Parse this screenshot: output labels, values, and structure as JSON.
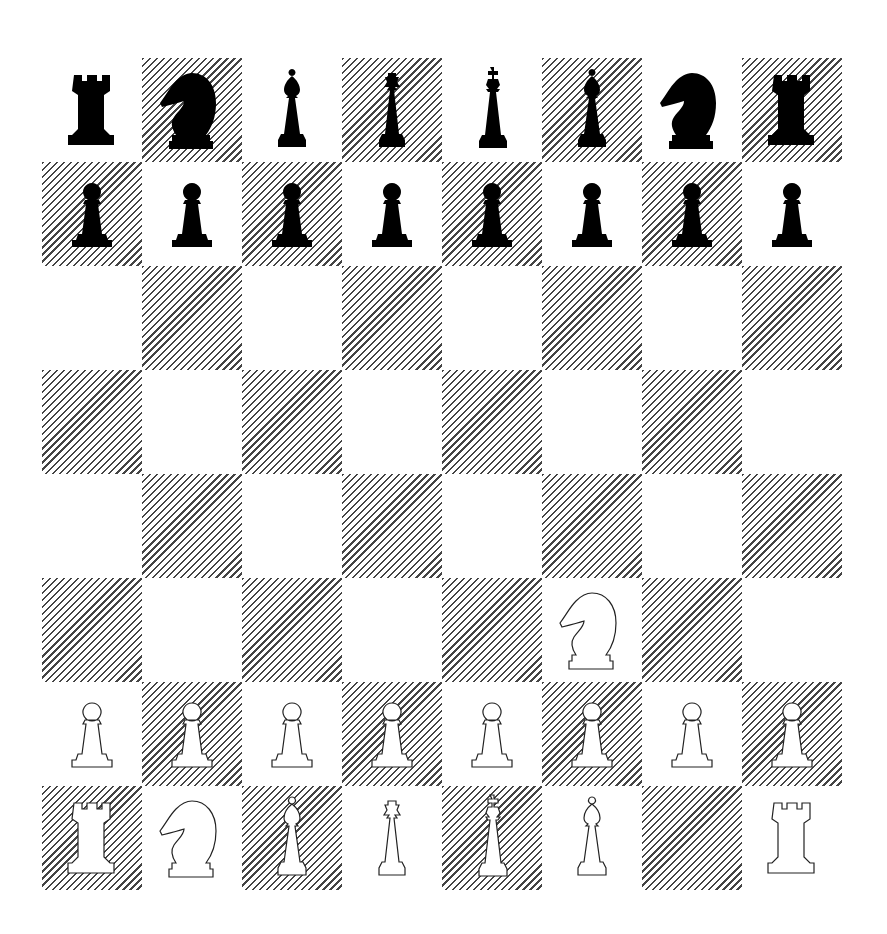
{
  "game": {
    "type": "chess",
    "orientation": "white-at-bottom",
    "colors": {
      "light_square": "#ffffff",
      "dark_square_hatch": "#444444",
      "black_piece": "#000000",
      "white_piece_fill": "#ffffff",
      "white_piece_outline": "#222222"
    },
    "last_move": "Ng1-f3",
    "board": [
      [
        "br",
        "bn",
        "bb",
        "bq",
        "bk",
        "bb",
        "bn",
        "br"
      ],
      [
        "bp",
        "bp",
        "bp",
        "bp",
        "bp",
        "bp",
        "bp",
        "bp"
      ],
      [
        "",
        "",
        "",
        "",
        "",
        "",
        "",
        ""
      ],
      [
        "",
        "",
        "",
        "",
        "",
        "",
        "",
        ""
      ],
      [
        "",
        "",
        "",
        "",
        "",
        "",
        "",
        ""
      ],
      [
        "",
        "",
        "",
        "",
        "",
        "wn",
        "",
        ""
      ],
      [
        "wp",
        "wp",
        "wp",
        "wp",
        "wp",
        "wp",
        "wp",
        "wp"
      ],
      [
        "wr",
        "wn",
        "wb",
        "wq",
        "wk",
        "wb",
        "",
        "wr"
      ]
    ],
    "files": [
      "a",
      "b",
      "c",
      "d",
      "e",
      "f",
      "g",
      "h"
    ],
    "ranks": [
      "8",
      "7",
      "6",
      "5",
      "4",
      "3",
      "2",
      "1"
    ],
    "piece_names": {
      "r": "rook",
      "n": "knight",
      "b": "bishop",
      "q": "queen",
      "k": "king",
      "p": "pawn"
    }
  }
}
